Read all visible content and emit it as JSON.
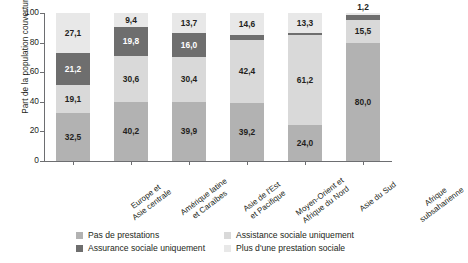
{
  "chart_data": {
    "type": "bar",
    "subtype": "100% stacked bar",
    "title": "",
    "xlabel": "",
    "ylabel": "Part de la population couverture (%)",
    "ylim": [
      0,
      100
    ],
    "yticks": [
      "0",
      "20",
      "40",
      "60",
      "80",
      "100"
    ],
    "grid": false,
    "legend_position": "bottom",
    "categories": [
      "Europe et\nAsie centrale",
      "Amérique latine\net Caraïbes",
      "Asie de l'Est\net Pacifique",
      "Moyen-Orient et\nAfrique du Nord",
      "Asie du Sud",
      "Afrique\nsubsaharienne"
    ],
    "series": [
      {
        "name": "Pas de prestations",
        "color": "#b2b2b2",
        "values": [
          32.5,
          40.2,
          39.9,
          39.2,
          24.0,
          80.0
        ],
        "labels": [
          "32,5",
          "40,2",
          "39,9",
          "39,2",
          "24,0",
          "80,0"
        ]
      },
      {
        "name": "Assistance sociale uniquement",
        "color": "#d9d9d9",
        "values": [
          19.1,
          30.6,
          30.4,
          42.4,
          61.2,
          15.5
        ],
        "labels": [
          "19,1",
          "30,6",
          "30,4",
          "42,4",
          "61,2",
          "15,5"
        ]
      },
      {
        "name": "Assurance sociale uniquement",
        "color": "#6e6e6e",
        "values": [
          21.2,
          19.8,
          16.0,
          3.8,
          1.5,
          3.3
        ],
        "labels": [
          "21,2",
          "19,8",
          "16,0",
          "",
          "",
          ""
        ]
      },
      {
        "name": "Plus d'une prestation sociale",
        "color": "#e8e8e8",
        "values": [
          27.1,
          9.4,
          13.7,
          14.6,
          13.3,
          1.2
        ],
        "labels": [
          "27,1",
          "9,4",
          "13,7",
          "14,6",
          "13,3",
          "1,2"
        ]
      }
    ]
  },
  "legend": {
    "items": [
      {
        "label": "Pas de prestations",
        "color": "#b2b2b2"
      },
      {
        "label": "Assistance sociale uniquement",
        "color": "#d9d9d9"
      },
      {
        "label": "Assurance sociale uniquement",
        "color": "#6e6e6e"
      },
      {
        "label": "Plus d'une prestation sociale",
        "color": "#e8e8e8"
      }
    ]
  }
}
